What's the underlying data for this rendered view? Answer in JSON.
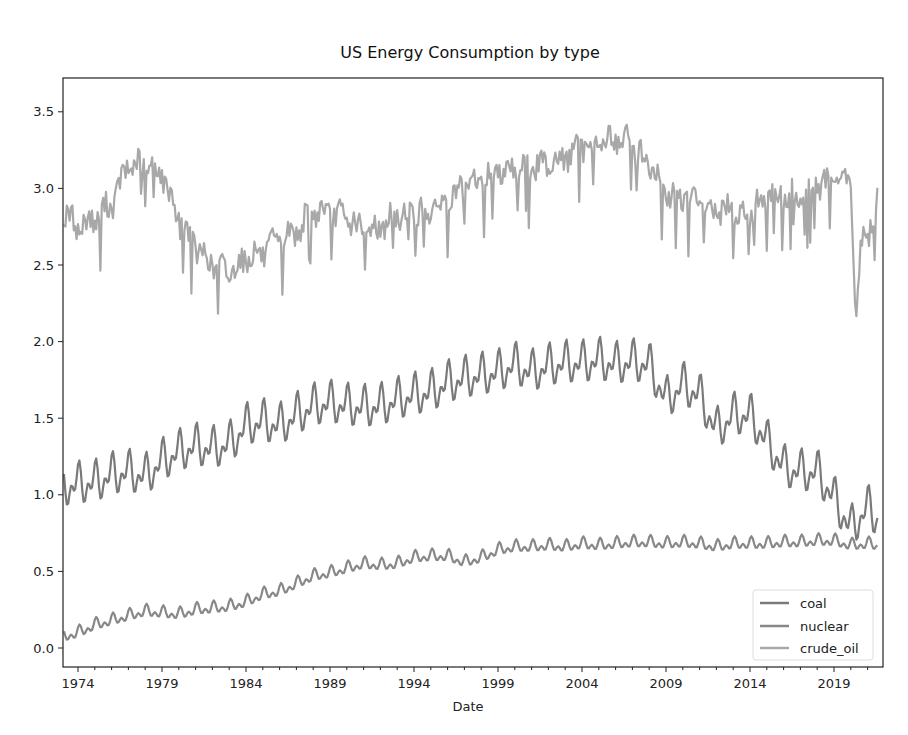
{
  "chart_data": {
    "type": "line",
    "title": "US Energy Consumption by type",
    "xlabel": "Date",
    "ylabel": "",
    "xlim": [
      1973.0,
      2022.0
    ],
    "ylim": [
      -0.12,
      3.72
    ],
    "x_ticks": [
      "1974",
      "1979",
      "1984",
      "1989",
      "1994",
      "1999",
      "2004",
      "2009",
      "2014",
      "2019"
    ],
    "y_ticks": [
      "0.0",
      "0.5",
      "1.0",
      "1.5",
      "2.0",
      "2.5",
      "3.0",
      "3.5"
    ],
    "grid": false,
    "legend_position": "lower right",
    "series": [
      {
        "name": "coal",
        "color": "#7a7a7a",
        "x": [
          1973,
          1974,
          1975,
          1976,
          1977,
          1978,
          1979,
          1980,
          1981,
          1982,
          1983,
          1984,
          1985,
          1986,
          1987,
          1988,
          1989,
          1990,
          1991,
          1992,
          1993,
          1994,
          1995,
          1996,
          1997,
          1998,
          1999,
          2000,
          2001,
          2002,
          2003,
          2004,
          2005,
          2006,
          2007,
          2008,
          2009,
          2010,
          2011,
          2012,
          2013,
          2014,
          2015,
          2016,
          2017,
          2018,
          2019,
          2020,
          2021,
          2021.6
        ],
        "values": [
          1.05,
          1.07,
          1.08,
          1.13,
          1.15,
          1.12,
          1.22,
          1.28,
          1.32,
          1.3,
          1.33,
          1.45,
          1.48,
          1.45,
          1.52,
          1.58,
          1.6,
          1.58,
          1.57,
          1.58,
          1.62,
          1.65,
          1.67,
          1.73,
          1.76,
          1.78,
          1.8,
          1.85,
          1.8,
          1.84,
          1.86,
          1.86,
          1.88,
          1.85,
          1.87,
          1.85,
          1.62,
          1.72,
          1.65,
          1.42,
          1.52,
          1.52,
          1.35,
          1.18,
          1.15,
          1.15,
          0.98,
          0.78,
          0.92,
          0.85
        ],
        "amplitude": 0.15
      },
      {
        "name": "nuclear",
        "color": "#888888",
        "x": [
          1973,
          1974,
          1975,
          1976,
          1977,
          1978,
          1979,
          1980,
          1981,
          1982,
          1983,
          1984,
          1985,
          1986,
          1987,
          1988,
          1989,
          1990,
          1991,
          1992,
          1993,
          1994,
          1995,
          1996,
          1997,
          1998,
          1999,
          2000,
          2001,
          2002,
          2003,
          2004,
          2005,
          2006,
          2007,
          2008,
          2009,
          2010,
          2011,
          2012,
          2013,
          2014,
          2015,
          2016,
          2017,
          2018,
          2019,
          2020,
          2021,
          2021.6
        ],
        "values": [
          0.07,
          0.1,
          0.15,
          0.18,
          0.21,
          0.24,
          0.23,
          0.22,
          0.25,
          0.26,
          0.27,
          0.3,
          0.35,
          0.37,
          0.42,
          0.47,
          0.49,
          0.52,
          0.55,
          0.54,
          0.55,
          0.59,
          0.6,
          0.6,
          0.56,
          0.59,
          0.64,
          0.66,
          0.66,
          0.67,
          0.66,
          0.68,
          0.67,
          0.68,
          0.69,
          0.69,
          0.68,
          0.69,
          0.68,
          0.66,
          0.68,
          0.68,
          0.68,
          0.69,
          0.69,
          0.7,
          0.7,
          0.67,
          0.68,
          0.67
        ],
        "amplitude": 0.05
      },
      {
        "name": "crude_oil",
        "color": "#a8a8a8",
        "x": [
          1973,
          1974,
          1975,
          1976,
          1977,
          1978,
          1979,
          1980,
          1981,
          1982,
          1983,
          1984,
          1985,
          1986,
          1987,
          1988,
          1989,
          1990,
          1991,
          1992,
          1993,
          1994,
          1995,
          1996,
          1997,
          1998,
          1999,
          2000,
          2001,
          2002,
          2003,
          2004,
          2005,
          2006,
          2007,
          2008,
          2009,
          2010,
          2011,
          2012,
          2013,
          2014,
          2015,
          2016,
          2017,
          2018,
          2019,
          2020,
          2020.3,
          2020.7,
          2021,
          2021.6
        ],
        "values": [
          2.85,
          2.75,
          2.8,
          2.9,
          3.15,
          3.15,
          3.1,
          2.8,
          2.62,
          2.5,
          2.45,
          2.55,
          2.58,
          2.65,
          2.72,
          2.85,
          2.85,
          2.8,
          2.72,
          2.75,
          2.82,
          2.85,
          2.85,
          2.92,
          3.0,
          3.05,
          3.12,
          3.15,
          3.12,
          3.18,
          3.2,
          3.28,
          3.3,
          3.32,
          3.3,
          3.15,
          2.95,
          2.95,
          2.9,
          2.85,
          2.85,
          2.85,
          2.95,
          2.95,
          2.95,
          3.02,
          3.05,
          3.05,
          2.15,
          2.7,
          2.7,
          2.9
        ],
        "amplitude": 0.1
      }
    ]
  },
  "legend": {
    "items": [
      {
        "label": "coal",
        "color": "#7a7a7a"
      },
      {
        "label": "nuclear",
        "color": "#888888"
      },
      {
        "label": "crude_oil",
        "color": "#a8a8a8"
      }
    ]
  }
}
